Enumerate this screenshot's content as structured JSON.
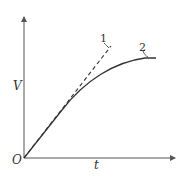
{
  "diagram": {
    "axes": {
      "y_label": "V",
      "x_label": "t",
      "origin_label": "O"
    },
    "curves": [
      {
        "id": "1",
        "label": "1",
        "style": "dashed",
        "shape": "straight line (initial tangent)"
      },
      {
        "id": "2",
        "label": "2",
        "style": "solid",
        "shape": "concave curve leveling off"
      }
    ],
    "colors": {
      "line": "#333333",
      "axis": "#555555"
    }
  }
}
